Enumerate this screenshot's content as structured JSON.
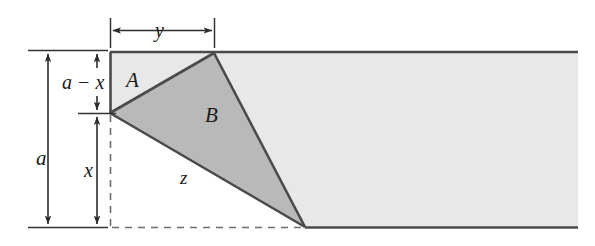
{
  "figure": {
    "kind": "folded-paper-geometry-diagram",
    "width": 595,
    "height": 246,
    "background_color": "#ffffff"
  },
  "labels": {
    "strip_height": "a",
    "upper_segment": "a − x",
    "lower_segment": "x",
    "fold_width": "y",
    "region_a": "A",
    "region_b": "B",
    "crease_length": "z"
  },
  "colors": {
    "strip_fill": "#e8e8e8",
    "fold_fill": "#b9b9b9",
    "outline": "#4a4a4a",
    "dimension_line": "#333333",
    "dashed_line": "#6e6e6e",
    "text": "#1a1a1a"
  },
  "geometry": {
    "strip": {
      "left_x": 110,
      "right_x": 578,
      "top_y": 52,
      "bottom_y": 228
    },
    "fold_triangle_b": {
      "left_vertex": [
        110,
        113
      ],
      "apex_vertex": [
        214,
        53
      ],
      "bottom_vertex": [
        305,
        227
      ]
    },
    "region_a_triangle": {
      "top_left": [
        110,
        52
      ],
      "apex": [
        214,
        53
      ],
      "left_vertex": [
        110,
        113
      ]
    },
    "dimensions": {
      "a": {
        "x": 48,
        "from_y": 50,
        "to_y": 227
      },
      "a_minus_x": {
        "x": 97,
        "from_y": 50,
        "to_y": 113
      },
      "x": {
        "x": 97,
        "from_y": 113,
        "to_y": 227
      },
      "y": {
        "y": 30,
        "from_x": 110,
        "to_x": 214
      }
    }
  }
}
